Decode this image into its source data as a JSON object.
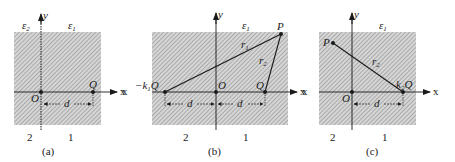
{
  "diagram": {
    "panels": [
      {
        "id": "a",
        "caption": "(a)",
        "region_labels": {
          "left_num": "2",
          "right_num": "1",
          "left_eps": "ε2",
          "right_eps": "ε1"
        },
        "axis_labels": {
          "x": "x",
          "y": "y",
          "origin": "O"
        },
        "charges": [
          {
            "label": "Q",
            "x_offset": "d"
          }
        ],
        "dimension": "d"
      },
      {
        "id": "b",
        "caption": "(b)",
        "region_labels": {
          "left_num": "2",
          "right_num": "1",
          "eps": "ε1"
        },
        "axis_labels": {
          "x_left": "x",
          "x": "x",
          "y": "y",
          "origin": "O"
        },
        "charges": [
          {
            "label": "−k1Q",
            "x_offset": "-d"
          },
          {
            "label": "Q",
            "x_offset": "d"
          }
        ],
        "point": "P",
        "distances": [
          "r1",
          "r2"
        ],
        "dimension_left": "d",
        "dimension_right": "d"
      },
      {
        "id": "c",
        "caption": "(c)",
        "region_labels": {
          "left_num": "2",
          "right_num": "1",
          "eps": "ε1"
        },
        "axis_labels": {
          "x_left": "x",
          "x": "x",
          "y": "y",
          "origin": "O"
        },
        "charges": [
          {
            "label": "k2Q",
            "x_offset": "d"
          }
        ],
        "point": "P",
        "distances": [
          "r2"
        ],
        "dimension": "d"
      }
    ]
  },
  "labels": {
    "a_y": "y",
    "a_x": "x",
    "a_O": "O",
    "a_Q": "Q",
    "a_d": "d",
    "a_eps2": "ε",
    "a_eps2_sub": "2",
    "a_eps1": "ε",
    "a_eps1_sub": "1",
    "a_two": "2",
    "a_one": "1",
    "a_cap": "(a)",
    "b_y": "y",
    "b_x": "x",
    "b_xl": "x",
    "b_O": "O",
    "b_Q": "Q",
    "b_P": "P",
    "b_k": "−k",
    "b_k_sub": "1",
    "b_kQ": "Q",
    "b_r1": "r",
    "b_r1_sub": "1",
    "b_r2": "r",
    "b_r2_sub": "2",
    "b_d1": "d",
    "b_d2": "d",
    "b_eps1": "ε",
    "b_eps1_sub": "1",
    "b_two": "2",
    "b_one": "1",
    "b_cap": "(b)",
    "c_y": "y",
    "c_x": "x",
    "c_xl": "x",
    "c_O": "O",
    "c_P": "P",
    "c_k": "k",
    "c_k_sub": "2",
    "c_kQ": "Q",
    "c_r2": "r",
    "c_r2_sub": "2",
    "c_d": "d",
    "c_eps1": "ε",
    "c_eps1_sub": "1",
    "c_two": "2",
    "c_one": "1",
    "c_cap": "(c)"
  },
  "colors": {
    "hatch": "#9a9a9a",
    "hatch_bg": "#d4d4d4",
    "ink": "#1a1a1a"
  }
}
